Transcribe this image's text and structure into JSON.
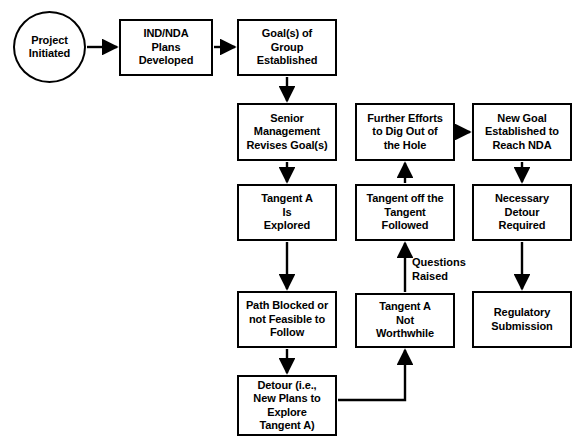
{
  "diagram": {
    "background_color": "#ffffff",
    "line_color": "#000000",
    "nodes": [
      {
        "id": "project-initiated",
        "shape": "circle",
        "label": "Project\nInitiated",
        "x": 13,
        "y": 11,
        "w": 73,
        "h": 72
      },
      {
        "id": "ind-nda-plans-developed",
        "shape": "rect",
        "label": "IND/NDA\nPlans\nDeveloped",
        "x": 119,
        "y": 19,
        "w": 94,
        "h": 57
      },
      {
        "id": "goals-of-group-established",
        "shape": "rect",
        "label": "Goal(s) of\nGroup\nEstablished",
        "x": 237,
        "y": 19,
        "w": 100,
        "h": 57
      },
      {
        "id": "senior-management-revises-goals",
        "shape": "rect",
        "label": "Senior\nManagement\nRevises Goal(s)",
        "x": 237,
        "y": 103,
        "w": 100,
        "h": 58
      },
      {
        "id": "tangent-a-is-explored",
        "shape": "rect",
        "label": "Tangent A\nIs\nExplored",
        "x": 237,
        "y": 184,
        "w": 100,
        "h": 57
      },
      {
        "id": "path-blocked-or-not-feasible",
        "shape": "rect",
        "label": "Path Blocked or\nnot Feasible to\nFollow",
        "x": 237,
        "y": 291,
        "w": 100,
        "h": 57
      },
      {
        "id": "detour-new-plans",
        "shape": "rect",
        "label": "Detour (i.e.,\nNew Plans to\nExplore\nTangent A)",
        "x": 237,
        "y": 375,
        "w": 100,
        "h": 61
      },
      {
        "id": "further-efforts-dig-out",
        "shape": "rect",
        "label": "Further Efforts\nto Dig Out of\nthe Hole",
        "x": 355,
        "y": 103,
        "w": 100,
        "h": 58
      },
      {
        "id": "tangent-off-the-tangent-followed",
        "shape": "rect",
        "label": "Tangent off the\nTangent\nFollowed",
        "x": 355,
        "y": 184,
        "w": 100,
        "h": 57
      },
      {
        "id": "tangent-a-not-worthwhile",
        "shape": "rect",
        "label": "Tangent A\nNot\nWorthwhile",
        "x": 355,
        "y": 293,
        "w": 100,
        "h": 55
      },
      {
        "id": "new-goal-established-reach-nda",
        "shape": "rect",
        "label": "New Goal\nEstablished to\nReach NDA",
        "x": 472,
        "y": 103,
        "w": 100,
        "h": 58
      },
      {
        "id": "necessary-detour-required",
        "shape": "rect",
        "label": "Necessary\nDetour\nRequired",
        "x": 472,
        "y": 184,
        "w": 100,
        "h": 57
      },
      {
        "id": "regulatory-submission",
        "shape": "rect",
        "label": "Regulatory\nSubmission",
        "x": 472,
        "y": 291,
        "w": 100,
        "h": 57
      }
    ],
    "edge_labels": [
      {
        "id": "questions-raised",
        "text": "Questions\nRaised",
        "x": 412,
        "y": 256
      }
    ],
    "edges": [
      {
        "from": "project-initiated",
        "to": "ind-nda-plans-developed",
        "kind": "arrow-right"
      },
      {
        "from": "ind-nda-plans-developed",
        "to": "goals-of-group-established",
        "kind": "arrow-right"
      },
      {
        "from": "goals-of-group-established",
        "to": "senior-management-revises-goals",
        "kind": "arrow-down"
      },
      {
        "from": "senior-management-revises-goals",
        "to": "tangent-a-is-explored",
        "kind": "arrow-down"
      },
      {
        "from": "tangent-a-is-explored",
        "to": "path-blocked-or-not-feasible",
        "kind": "arrow-down"
      },
      {
        "from": "path-blocked-or-not-feasible",
        "to": "detour-new-plans",
        "kind": "arrow-down"
      },
      {
        "from": "detour-new-plans",
        "to": "tangent-a-not-worthwhile",
        "kind": "elbow-right-up"
      },
      {
        "from": "tangent-a-not-worthwhile",
        "to": "tangent-off-the-tangent-followed",
        "kind": "arrow-up",
        "label": "Questions Raised"
      },
      {
        "from": "tangent-off-the-tangent-followed",
        "to": "further-efforts-dig-out",
        "kind": "arrow-up"
      },
      {
        "from": "further-efforts-dig-out",
        "to": "new-goal-established-reach-nda",
        "kind": "arrow-right"
      },
      {
        "from": "new-goal-established-reach-nda",
        "to": "necessary-detour-required",
        "kind": "arrow-down"
      },
      {
        "from": "necessary-detour-required",
        "to": "regulatory-submission",
        "kind": "arrow-down"
      }
    ]
  }
}
